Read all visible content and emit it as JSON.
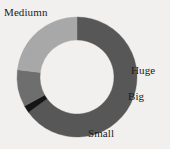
{
  "chart_data": {
    "type": "pie",
    "variant": "donut",
    "title": "",
    "subtitle": "",
    "xlabel": "",
    "ylabel": "",
    "legend_position": "none",
    "labels_position": "outside",
    "grid": false,
    "background_color": "#f2f0ee",
    "center": {
      "x": 77,
      "y": 77
    },
    "outer_radius": 60,
    "inner_radius": 37,
    "start_angle_deg": 0,
    "direction": "clockwise",
    "categories": [
      "Mediumn",
      "Huge",
      "Big",
      "Small"
    ],
    "values": [
      65,
      2,
      10,
      23
    ],
    "units": "percent",
    "slices": [
      {
        "label": "Mediumn",
        "value": 65,
        "color": "#575757",
        "start_angle_deg": 0,
        "end_angle_deg": 234,
        "label_x": 4,
        "label_y": 6
      },
      {
        "label": "Huge",
        "value": 2,
        "color": "#151515",
        "start_angle_deg": 234,
        "end_angle_deg": 241,
        "label_x": 131,
        "label_y": 64
      },
      {
        "label": "Big",
        "value": 10,
        "color": "#6e6e6e",
        "start_angle_deg": 241,
        "end_angle_deg": 277,
        "label_x": 128,
        "label_y": 90
      },
      {
        "label": "Small",
        "value": 23,
        "color": "#a8a8a8",
        "start_angle_deg": 277,
        "end_angle_deg": 360,
        "label_x": 88,
        "label_y": 127
      }
    ]
  },
  "labels": {
    "mediumn": "Mediumn",
    "huge": "Huge",
    "big": "Big",
    "small": "Small"
  },
  "colors": {
    "mediumn": "#575757",
    "huge": "#151515",
    "big": "#6e6e6e",
    "small": "#a8a8a8",
    "background": "#f2f0ee",
    "text": "#1b1b1b"
  }
}
